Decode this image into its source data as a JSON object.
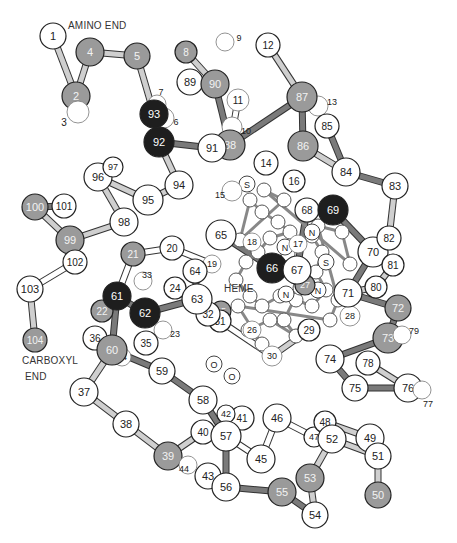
{
  "captions": {
    "amino_end": "AMINO END",
    "carboxyl_end_line1": "CARBOXYL",
    "carboxyl_end_line2": "END",
    "heme": "HEME"
  },
  "colors": {
    "white": "#ffffff",
    "gray": "#9a9a9a",
    "dark": "#1e1e1e",
    "bond_light": "#cfcfcf",
    "bond_dark": "#7a7a7a"
  },
  "heme_atoms": {
    "sulfur_1": "S",
    "sulfur_2": "S",
    "iron": "Fe",
    "nitrogen_1": "N",
    "nitrogen_2": "N",
    "nitrogen_3": "N",
    "nitrogen_4": "N",
    "oxygen_1": "O",
    "oxygen_2": "O"
  },
  "residues": [
    {
      "n": "1",
      "shade": "white"
    },
    {
      "n": "2",
      "shade": "gray"
    },
    {
      "n": "3",
      "shade": "outline"
    },
    {
      "n": "4",
      "shade": "gray"
    },
    {
      "n": "5",
      "shade": "gray"
    },
    {
      "n": "6",
      "shade": "outline"
    },
    {
      "n": "7",
      "shade": "outline"
    },
    {
      "n": "8",
      "shade": "gray"
    },
    {
      "n": "9",
      "shade": "outline"
    },
    {
      "n": "10",
      "shade": "outline"
    },
    {
      "n": "11",
      "shade": "outline"
    },
    {
      "n": "12",
      "shade": "white"
    },
    {
      "n": "13",
      "shade": "outline"
    },
    {
      "n": "14",
      "shade": "white"
    },
    {
      "n": "15",
      "shade": "outline"
    },
    {
      "n": "16",
      "shade": "white"
    },
    {
      "n": "17",
      "shade": "outline"
    },
    {
      "n": "18",
      "shade": "outline"
    },
    {
      "n": "19",
      "shade": "outline"
    },
    {
      "n": "20",
      "shade": "white"
    },
    {
      "n": "21",
      "shade": "gray"
    },
    {
      "n": "22",
      "shade": "gray"
    },
    {
      "n": "23",
      "shade": "outline"
    },
    {
      "n": "24",
      "shade": "white"
    },
    {
      "n": "25",
      "shade": "gray"
    },
    {
      "n": "26",
      "shade": "outline"
    },
    {
      "n": "27",
      "shade": "gray"
    },
    {
      "n": "28",
      "shade": "outline"
    },
    {
      "n": "29",
      "shade": "white"
    },
    {
      "n": "30",
      "shade": "outline"
    },
    {
      "n": "31",
      "shade": "white"
    },
    {
      "n": "32",
      "shade": "white"
    },
    {
      "n": "33",
      "shade": "outline"
    },
    {
      "n": "34",
      "shade": "outline"
    },
    {
      "n": "35",
      "shade": "white"
    },
    {
      "n": "36",
      "shade": "white"
    },
    {
      "n": "37",
      "shade": "white"
    },
    {
      "n": "38",
      "shade": "white"
    },
    {
      "n": "39",
      "shade": "gray"
    },
    {
      "n": "40",
      "shade": "white"
    },
    {
      "n": "41",
      "shade": "white"
    },
    {
      "n": "42",
      "shade": "white"
    },
    {
      "n": "43",
      "shade": "white"
    },
    {
      "n": "44",
      "shade": "outline"
    },
    {
      "n": "45",
      "shade": "white"
    },
    {
      "n": "46",
      "shade": "white"
    },
    {
      "n": "47",
      "shade": "white"
    },
    {
      "n": "48",
      "shade": "white"
    },
    {
      "n": "49",
      "shade": "white"
    },
    {
      "n": "50",
      "shade": "gray"
    },
    {
      "n": "51",
      "shade": "white"
    },
    {
      "n": "52",
      "shade": "white"
    },
    {
      "n": "53",
      "shade": "gray"
    },
    {
      "n": "54",
      "shade": "white"
    },
    {
      "n": "55",
      "shade": "gray"
    },
    {
      "n": "56",
      "shade": "white"
    },
    {
      "n": "57",
      "shade": "white"
    },
    {
      "n": "58",
      "shade": "white"
    },
    {
      "n": "59",
      "shade": "white"
    },
    {
      "n": "60",
      "shade": "gray"
    },
    {
      "n": "61",
      "shade": "dark"
    },
    {
      "n": "62",
      "shade": "dark"
    },
    {
      "n": "63",
      "shade": "white"
    },
    {
      "n": "64",
      "shade": "white"
    },
    {
      "n": "65",
      "shade": "white"
    },
    {
      "n": "66",
      "shade": "dark"
    },
    {
      "n": "67",
      "shade": "white"
    },
    {
      "n": "68",
      "shade": "white"
    },
    {
      "n": "69",
      "shade": "dark"
    },
    {
      "n": "70",
      "shade": "white"
    },
    {
      "n": "71",
      "shade": "white"
    },
    {
      "n": "72",
      "shade": "gray"
    },
    {
      "n": "73",
      "shade": "gray"
    },
    {
      "n": "74",
      "shade": "white"
    },
    {
      "n": "75",
      "shade": "white"
    },
    {
      "n": "76",
      "shade": "white"
    },
    {
      "n": "77",
      "shade": "outline"
    },
    {
      "n": "78",
      "shade": "white"
    },
    {
      "n": "79",
      "shade": "outline"
    },
    {
      "n": "80",
      "shade": "white"
    },
    {
      "n": "81",
      "shade": "white"
    },
    {
      "n": "82",
      "shade": "white"
    },
    {
      "n": "83",
      "shade": "white"
    },
    {
      "n": "84",
      "shade": "white"
    },
    {
      "n": "85",
      "shade": "white"
    },
    {
      "n": "86",
      "shade": "gray"
    },
    {
      "n": "87",
      "shade": "gray"
    },
    {
      "n": "88",
      "shade": "gray"
    },
    {
      "n": "89",
      "shade": "white"
    },
    {
      "n": "90",
      "shade": "gray"
    },
    {
      "n": "91",
      "shade": "white"
    },
    {
      "n": "92",
      "shade": "dark"
    },
    {
      "n": "93",
      "shade": "dark"
    },
    {
      "n": "94",
      "shade": "white"
    },
    {
      "n": "95",
      "shade": "white"
    },
    {
      "n": "96",
      "shade": "white"
    },
    {
      "n": "97",
      "shade": "white"
    },
    {
      "n": "98",
      "shade": "white"
    },
    {
      "n": "99",
      "shade": "gray"
    },
    {
      "n": "100",
      "shade": "gray"
    },
    {
      "n": "101",
      "shade": "white"
    },
    {
      "n": "102",
      "shade": "white"
    },
    {
      "n": "103",
      "shade": "white"
    },
    {
      "n": "104",
      "shade": "gray"
    }
  ]
}
